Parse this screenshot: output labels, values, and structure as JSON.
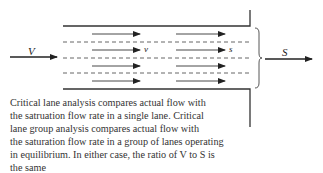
{
  "diagram": {
    "labels": {
      "input": "V",
      "output": "S",
      "lane_flow": "v",
      "lane_saturation": "s"
    },
    "lanes": 4,
    "colors": {
      "line": "#333333",
      "dash": "#555555",
      "text": "#333333"
    }
  },
  "caption": {
    "lines": [
      "Critical lane analysis compares actual flow with",
      "the satruation flow rate in a single lane.  Critical",
      "lane group analysis compares actual flow with",
      "the saturation flow rate in a group of lanes operating",
      "in equilibrium.  In either case, the ratio of V to S is",
      "the same"
    ]
  }
}
